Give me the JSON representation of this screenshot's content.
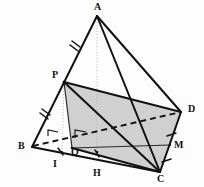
{
  "figure": {
    "kind": "geometry-diagram",
    "background_color": "#fdfdfd",
    "stroke_color": "#111111",
    "shaded_face_color": "#c8c8c8",
    "guide_color": "#b4b4b4",
    "vertices": [
      {
        "id": "A",
        "label": "A",
        "x": 97,
        "y": 16,
        "label_x": 94,
        "label_y": 2
      },
      {
        "id": "P",
        "label": "P",
        "x": 64,
        "y": 82,
        "label_x": 52,
        "label_y": 70
      },
      {
        "id": "B",
        "label": "B",
        "x": 32,
        "y": 147,
        "label_x": 18,
        "label_y": 141
      },
      {
        "id": "D",
        "label": "D",
        "x": 181,
        "y": 112,
        "label_x": 188,
        "label_y": 104
      },
      {
        "id": "M",
        "label": "M",
        "x": 170,
        "y": 145,
        "label_x": 174,
        "label_y": 140
      },
      {
        "id": "C",
        "label": "C",
        "x": 160,
        "y": 172,
        "label_x": 157,
        "label_y": 174
      },
      {
        "id": "Q",
        "label": "Q",
        "x": 72,
        "y": 148,
        "label_x": 71,
        "label_y": 147
      },
      {
        "id": "I",
        "label": "I",
        "x": 62,
        "y": 152,
        "label_x": 53,
        "label_y": 159
      },
      {
        "id": "H",
        "label": "H",
        "x": 97,
        "y": 152,
        "label_x": 93,
        "label_y": 168
      }
    ],
    "solid_edges": [
      {
        "name": "edge-A-B",
        "from": "A",
        "to": "B"
      },
      {
        "name": "edge-A-C",
        "from": "A",
        "to": "C"
      },
      {
        "name": "edge-A-D",
        "from": "A",
        "to": "D"
      },
      {
        "name": "edge-B-C",
        "from": "B",
        "to": "C"
      },
      {
        "name": "edge-D-C",
        "from": "D",
        "to": "C"
      },
      {
        "name": "edge-P-C",
        "from": "P",
        "to": "C"
      },
      {
        "name": "edge-P-D",
        "from": "P",
        "to": "D"
      },
      {
        "name": "edge-P-Q",
        "from": "P",
        "to": "Q"
      },
      {
        "name": "edge-Q-C",
        "from": "Q",
        "to": "C"
      },
      {
        "name": "edge-Q-M",
        "from": "Q",
        "to": "M"
      }
    ],
    "dashed_edges": [
      {
        "name": "edge-B-D-hidden",
        "from": "B",
        "to": "D"
      }
    ],
    "dotted_guides": [
      {
        "name": "guide-A-H",
        "from": "A",
        "to": "H"
      },
      {
        "name": "guide-P-I",
        "from": "P",
        "to": "I"
      }
    ],
    "shaded_faces": [
      {
        "name": "face-P-D-C-Q",
        "points": "P,D,C,Q"
      }
    ],
    "tick_marks": [
      {
        "name": "tick-A-P",
        "on": "edge-A-B",
        "t": 0.46,
        "count": 2
      },
      {
        "name": "tick-P-B",
        "on": "edge-A-B",
        "t": 0.86,
        "count": 2
      },
      {
        "name": "tick-D-M",
        "on": "edge-D-C",
        "t": 0.47,
        "count": 1
      },
      {
        "name": "tick-M-C",
        "on": "edge-D-C",
        "t": 0.83,
        "count": 1
      },
      {
        "name": "tick-B-I",
        "on": "edge-B-C",
        "t": 0.22,
        "count": 1
      },
      {
        "name": "tick-Q-H",
        "on": "edge-B-C",
        "t": 0.5,
        "count": 1
      }
    ],
    "right_angle_marks": [
      {
        "name": "right-angle-at-I",
        "x": 52,
        "y": 133
      },
      {
        "name": "right-angle-at-Q",
        "x": 79,
        "y": 129
      }
    ]
  }
}
